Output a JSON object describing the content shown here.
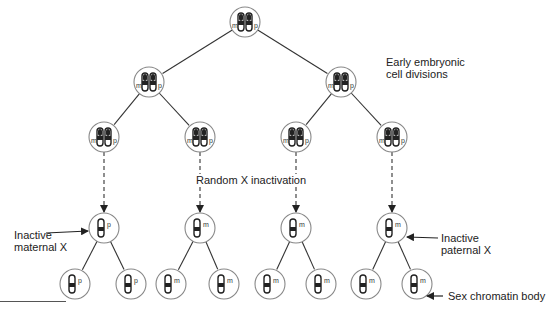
{
  "labels": {
    "early_line1": "Early embryonic",
    "early_line2": "cell divisions",
    "random": "Random X inactivation",
    "inactive_maternal_line1": "Inactive",
    "inactive_maternal_line2": "maternal X",
    "inactive_paternal_line1": "Inactive",
    "inactive_paternal_line2": "paternal X",
    "sex_chromatin": "Sex chromatin body"
  },
  "cells": [
    {
      "id": "root",
      "x": 245,
      "y": 22,
      "type": "double",
      "tag_left": "m",
      "tag_right": "p"
    },
    {
      "id": "l2a",
      "x": 149,
      "y": 82,
      "type": "double",
      "tag_left": "m",
      "tag_right": "p"
    },
    {
      "id": "l2b",
      "x": 341,
      "y": 82,
      "type": "double",
      "tag_left": "m",
      "tag_right": "p"
    },
    {
      "id": "l3a",
      "x": 104,
      "y": 137,
      "type": "double",
      "tag_left": "m",
      "tag_right": "p"
    },
    {
      "id": "l3b",
      "x": 200,
      "y": 137,
      "type": "double",
      "tag_left": "m",
      "tag_right": "p"
    },
    {
      "id": "l3c",
      "x": 296,
      "y": 137,
      "type": "double",
      "tag_left": "m",
      "tag_right": "p"
    },
    {
      "id": "l3d",
      "x": 392,
      "y": 137,
      "type": "double",
      "tag_left": "m",
      "tag_right": "p"
    },
    {
      "id": "l4a",
      "x": 104,
      "y": 228,
      "type": "single",
      "tag": "p"
    },
    {
      "id": "l4b",
      "x": 200,
      "y": 228,
      "type": "single",
      "tag": "m"
    },
    {
      "id": "l4c",
      "x": 296,
      "y": 228,
      "type": "single",
      "tag": "m"
    },
    {
      "id": "l4d",
      "x": 392,
      "y": 228,
      "type": "single",
      "tag": "m"
    },
    {
      "id": "l5a",
      "x": 75,
      "y": 284,
      "type": "single",
      "tag": "p"
    },
    {
      "id": "l5b",
      "x": 131,
      "y": 284,
      "type": "single",
      "tag": "p"
    },
    {
      "id": "l5c",
      "x": 171,
      "y": 284,
      "type": "single",
      "tag": "m"
    },
    {
      "id": "l5d",
      "x": 224,
      "y": 284,
      "type": "single",
      "tag": "m"
    },
    {
      "id": "l5e",
      "x": 270,
      "y": 284,
      "type": "single",
      "tag": "m"
    },
    {
      "id": "l5f",
      "x": 321,
      "y": 284,
      "type": "single",
      "tag": "m"
    },
    {
      "id": "l5g",
      "x": 366,
      "y": 284,
      "type": "single",
      "tag": "m"
    },
    {
      "id": "l5h",
      "x": 417,
      "y": 284,
      "type": "single",
      "tag": "m"
    }
  ],
  "edges": [
    [
      "root",
      "l2a",
      "solid"
    ],
    [
      "root",
      "l2b",
      "solid"
    ],
    [
      "l2a",
      "l3a",
      "solid"
    ],
    [
      "l2a",
      "l3b",
      "solid"
    ],
    [
      "l2b",
      "l3c",
      "solid"
    ],
    [
      "l2b",
      "l3d",
      "solid"
    ],
    [
      "l3a",
      "l4a",
      "dashed"
    ],
    [
      "l3b",
      "l4b",
      "dashed"
    ],
    [
      "l3c",
      "l4c",
      "dashed"
    ],
    [
      "l3d",
      "l4d",
      "dashed"
    ],
    [
      "l4a",
      "l5a",
      "solid"
    ],
    [
      "l4a",
      "l5b",
      "solid"
    ],
    [
      "l4b",
      "l5c",
      "solid"
    ],
    [
      "l4b",
      "l5d",
      "solid"
    ],
    [
      "l4c",
      "l5e",
      "solid"
    ],
    [
      "l4c",
      "l5f",
      "solid"
    ],
    [
      "l4d",
      "l5g",
      "solid"
    ],
    [
      "l4d",
      "l5h",
      "solid"
    ]
  ],
  "colors": {
    "line": "#333333",
    "circle": "#888888",
    "chromosome": "#222222"
  }
}
